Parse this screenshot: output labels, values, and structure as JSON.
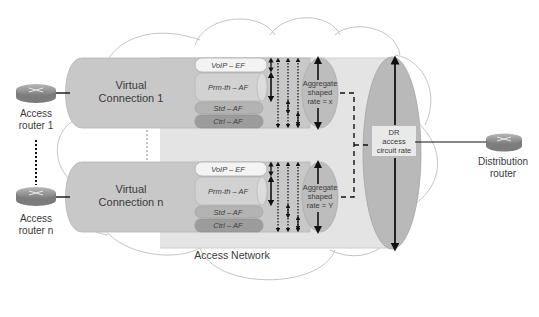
{
  "diagram": {
    "network_label": "Access Network",
    "access_routers": [
      {
        "line1": "Access",
        "line2": "router 1"
      },
      {
        "line1": "Access",
        "line2": "router n"
      }
    ],
    "distribution_router": {
      "line1": "Distribution",
      "line2": "router"
    },
    "virtual_connections": [
      {
        "line1": "Virtual",
        "line2": "Connection 1",
        "classes": [
          "VoIP – EF",
          "Prm-th – AF",
          "Std – AF",
          "Ctrl – AF"
        ],
        "aggregate": {
          "line1": "Aggregate",
          "line2": "shaped",
          "line3": "rate = x"
        }
      },
      {
        "line1": "Virtual",
        "line2": "Connection n",
        "classes": [
          "VoIP – EF",
          "Prm-th – AF",
          "Std – AF",
          "Ctrl – AF"
        ],
        "aggregate": {
          "line1": "Aggregate",
          "line2": "shaped",
          "line3": "rate = Y"
        }
      }
    ],
    "dr_circuit": {
      "line1": "DR",
      "line2": "access",
      "line3": "circuit rate"
    },
    "colors": {
      "cloud_stroke": "#bdbdbd",
      "tube_fill": "#c8c8c8",
      "big_tube_fill": "#e4e4e4",
      "voip_fill": "#f2f2f2",
      "prm_fill": "#d0d0d0",
      "std_fill": "#b0b0b0",
      "ctrl_fill": "#9a9a9a",
      "ellipse_fill": "#b8b8b8",
      "router_fill": "#9a9a9a"
    }
  }
}
